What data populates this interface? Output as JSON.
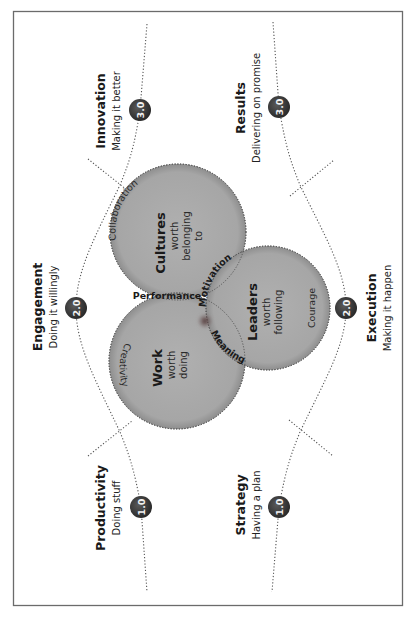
{
  "diagram": {
    "orientation": "rotated-90-ccw",
    "frame_color": "#6b6b6b",
    "circle_fill": "#a9a9a9",
    "badge_fill": "#3a3a3a",
    "focus_dot_color": "#5a3a3a",
    "stages": {
      "top": [
        {
          "title": "Productivity",
          "subtitle": "Doing stuff",
          "badge": "1.0"
        },
        {
          "title": "Engagement",
          "subtitle": "Doing it willingly",
          "badge": "2.0"
        },
        {
          "title": "Innovation",
          "subtitle": "Making it better",
          "badge": "3.0"
        }
      ],
      "bottom": [
        {
          "title": "Strategy",
          "subtitle": "Having a plan",
          "badge": "1.0"
        },
        {
          "title": "Execution",
          "subtitle": "Making it happen",
          "badge": "2.0"
        },
        {
          "title": "Results",
          "subtitle": "Delivering on promise",
          "badge": "3.0"
        }
      ]
    },
    "circles": {
      "cultures": {
        "title": "Cultures",
        "line1": "worth",
        "line2": "belonging",
        "line3": "to",
        "arc_label": "Collaboration"
      },
      "work": {
        "title": "Work",
        "line1": "worth",
        "line2": "doing",
        "arc_label": "Creativity"
      },
      "leaders": {
        "title": "Leaders",
        "line1": "worth",
        "line2": "following",
        "arc_label": "Courage"
      }
    },
    "overlaps": {
      "cultures_work": "Performance",
      "cultures_leaders": "Motivation",
      "work_leaders": "Meaning"
    }
  }
}
